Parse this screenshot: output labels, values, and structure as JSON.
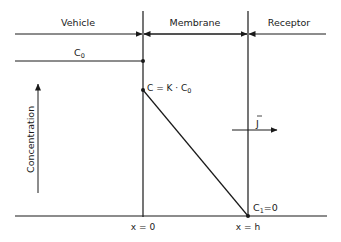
{
  "diagram": {
    "regions": [
      {
        "label": "Vehicle"
      },
      {
        "label": "Membrane"
      },
      {
        "label": "Receptor"
      }
    ],
    "labels": {
      "c0_main": "C",
      "c0_sub": "0",
      "c_surface": "C = K · C",
      "c_surface_sub": "0",
      "c1_main": "C",
      "c1_sub": "1",
      "c1_value": "=0",
      "flux": "J",
      "y_axis": "Concentration",
      "x0": "x = 0",
      "xh": "x = h"
    },
    "colors": {
      "ink": "#1a1a1a",
      "background": "#ffffff"
    }
  }
}
